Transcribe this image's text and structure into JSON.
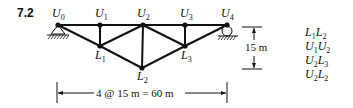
{
  "problem": {
    "number": "7.2"
  },
  "truss": {
    "nodes": [
      {
        "id": "U0",
        "letter": "U",
        "sub": "0",
        "x": 58,
        "y": 25
      },
      {
        "id": "U1",
        "letter": "U",
        "sub": "1",
        "x": 100,
        "y": 25
      },
      {
        "id": "U2",
        "letter": "U",
        "sub": "2",
        "x": 143,
        "y": 25
      },
      {
        "id": "U3",
        "letter": "U",
        "sub": "3",
        "x": 185,
        "y": 25
      },
      {
        "id": "U4",
        "letter": "U",
        "sub": "4",
        "x": 227,
        "y": 25
      },
      {
        "id": "L1",
        "letter": "L",
        "sub": "1",
        "x": 100,
        "y": 46
      },
      {
        "id": "L2",
        "letter": "L",
        "sub": "2",
        "x": 142,
        "y": 68
      },
      {
        "id": "L3",
        "letter": "L",
        "sub": "3",
        "x": 185,
        "y": 46
      }
    ],
    "members": [
      [
        "U0",
        "U1"
      ],
      [
        "U1",
        "U2"
      ],
      [
        "U2",
        "U3"
      ],
      [
        "U3",
        "U4"
      ],
      [
        "U0",
        "L1"
      ],
      [
        "L1",
        "L2"
      ],
      [
        "L2",
        "L3"
      ],
      [
        "L3",
        "U4"
      ],
      [
        "U1",
        "L1"
      ],
      [
        "U2",
        "L2"
      ],
      [
        "U3",
        "L3"
      ],
      [
        "L1",
        "U2"
      ],
      [
        "U2",
        "L3"
      ]
    ],
    "supports": {
      "left": "pin",
      "right": "roller"
    }
  },
  "dimensions": {
    "height_label": "15 m",
    "span_label": "4 @ 15 m = 60 m"
  },
  "member_list": [
    {
      "a_letter": "L",
      "a_sub": "1",
      "b_letter": "L",
      "b_sub": "2"
    },
    {
      "a_letter": "U",
      "a_sub": "1",
      "b_letter": "U",
      "b_sub": "2"
    },
    {
      "a_letter": "U",
      "a_sub": "2",
      "b_letter": "L",
      "b_sub": "3"
    },
    {
      "a_letter": "U",
      "a_sub": "2",
      "b_letter": "L",
      "b_sub": "2"
    }
  ]
}
